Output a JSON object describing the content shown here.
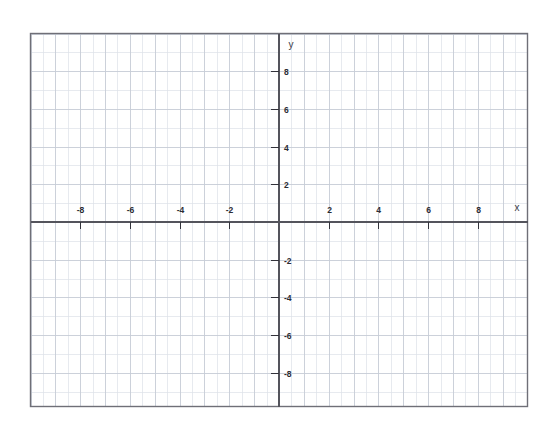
{
  "figure": {
    "kind": "cartesian-coordinate-grid",
    "background_color": "#ffffff",
    "plot_border_color": "#6f6f77",
    "minor_grid_color": "#d8dde6",
    "major_grid_color": "#c2c8d2",
    "axis_color": "#54545c",
    "tick_color": "#33333b",
    "label_color": "#2b2b33"
  },
  "axes": {
    "x_axis_label": "x",
    "y_axis_label": "y",
    "origin_label": ""
  },
  "chart_data": {
    "type": "scatter",
    "title": "",
    "subtitle": "",
    "xlabel": "x",
    "ylabel": "y",
    "xlim": [
      -10,
      10
    ],
    "ylim": [
      -10,
      10
    ],
    "x_major_step": 2,
    "y_major_step": 2,
    "x_minor_step": 0.5,
    "y_minor_step": 1,
    "grid": true,
    "legend": false,
    "legend_position": "none",
    "x_tick_labels": [
      "-8",
      "-6",
      "-4",
      "-2",
      "2",
      "4",
      "6",
      "8"
    ],
    "x_tick_values": [
      -8,
      -6,
      -4,
      -2,
      2,
      4,
      6,
      8
    ],
    "y_tick_labels": [
      "8",
      "6",
      "4",
      "2",
      "-2",
      "-4",
      "-6",
      "-8"
    ],
    "y_tick_values": [
      8,
      6,
      4,
      2,
      -2,
      -4,
      -6,
      -8
    ],
    "series": [
      {
        "name": "",
        "x": [],
        "y": [],
        "values": []
      }
    ],
    "annotations": [],
    "note": "Blank graph paper: coordinate plane with no plotted data points or curves."
  }
}
